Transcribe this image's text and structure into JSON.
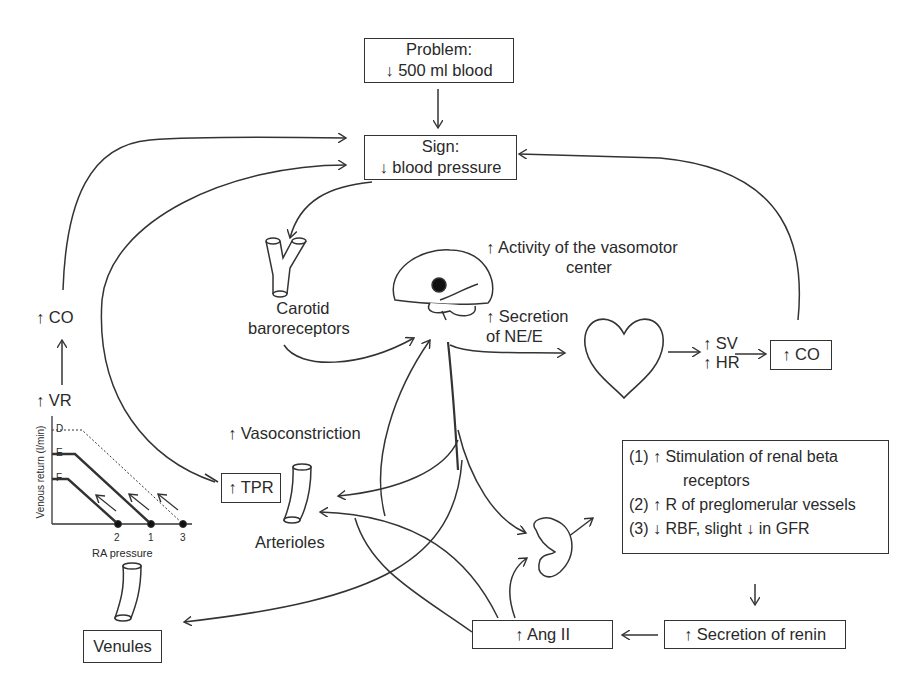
{
  "problem": {
    "title": "Problem:",
    "text": "↓ 500 ml blood"
  },
  "sign": {
    "title": "Sign:",
    "text": "↓ blood pressure"
  },
  "carotid": {
    "line1": "Carotid",
    "line2": "baroreceptors"
  },
  "vasomotor": {
    "line1": "↑ Activity of the vasomotor",
    "line2": "center"
  },
  "secretion_ne": {
    "line1": "↑ Secretion",
    "line2": "of NE/E"
  },
  "heart_outputs": {
    "sv": "↑ SV",
    "hr": "↑ HR"
  },
  "co_box": "↑ CO",
  "left_chain": {
    "co": "↑  CO",
    "vr": "↑  VR"
  },
  "vasoconstriction": "↑ Vasoconstriction",
  "tpr_box": "↑ TPR",
  "arterioles": "Arterioles",
  "venules": "Venules",
  "renal_effects": {
    "item1_line1": "(1) ↑ Stimulation of renal beta",
    "item1_line2": "receptors",
    "item2": "(2) ↑ R of preglomerular vessels",
    "item3": "(3) ↓ RBF, slight ↓ in GFR"
  },
  "renin_box": "↑ Secretion of renin",
  "ang_box": "↑ Ang II",
  "vr_graph": {
    "ylabel": "Venous return (l/min)",
    "xlabel": "RA pressure",
    "curves": [
      "D",
      "E",
      "F"
    ],
    "points": [
      "2",
      "1",
      "3"
    ]
  }
}
